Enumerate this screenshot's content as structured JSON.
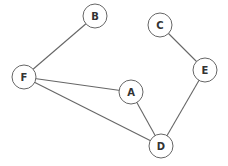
{
  "graph": {
    "nodes": [
      {
        "id": "B",
        "label": "B"
      },
      {
        "id": "C",
        "label": "C"
      },
      {
        "id": "E",
        "label": "E"
      },
      {
        "id": "F",
        "label": "F"
      },
      {
        "id": "A",
        "label": "A"
      },
      {
        "id": "D",
        "label": "D"
      }
    ],
    "edges": [
      {
        "from": "F",
        "to": "B"
      },
      {
        "from": "F",
        "to": "A"
      },
      {
        "from": "F",
        "to": "D"
      },
      {
        "from": "A",
        "to": "D"
      },
      {
        "from": "C",
        "to": "E"
      },
      {
        "from": "E",
        "to": "D"
      }
    ],
    "directed": false
  }
}
